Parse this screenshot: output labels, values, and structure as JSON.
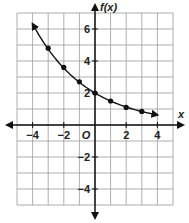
{
  "chart_data": {
    "type": "line",
    "title": "",
    "xlabel": "x",
    "ylabel": "f(x)",
    "origin_label": "O",
    "xlim": [
      -5,
      5
    ],
    "ylim": [
      -5,
      7
    ],
    "x_ticks": [
      -4,
      -2,
      2,
      4
    ],
    "y_ticks": [
      6,
      4,
      2,
      -2,
      -4
    ],
    "grid": true,
    "series": [
      {
        "name": "f(x)",
        "x": [
          -3,
          -2,
          -1,
          0,
          1,
          2,
          3
        ],
        "values": [
          4.8,
          3.6,
          2.7,
          2.0,
          1.5,
          1.1,
          0.85
        ],
        "curve_extends": {
          "from": [
            -4,
            6.4
          ],
          "to": [
            4,
            0.6
          ]
        },
        "arrows_both_ends": true
      }
    ]
  }
}
